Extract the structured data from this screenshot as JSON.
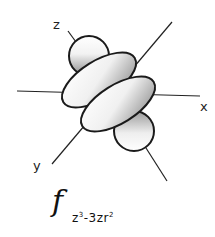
{
  "diagram": {
    "axes": {
      "x_label": "x",
      "y_label": "y",
      "z_label": "z"
    },
    "formula": {
      "main": "f",
      "subscript_part1": "z",
      "subscript_sup1": "3",
      "subscript_part2": "-3zr",
      "subscript_sup2": "2"
    },
    "colors": {
      "outline": "#1a1a1a",
      "lobe_light": "#ffffff",
      "lobe_dark": "#8a8a8a",
      "axis": "#222222",
      "background": "#ffffff"
    }
  }
}
